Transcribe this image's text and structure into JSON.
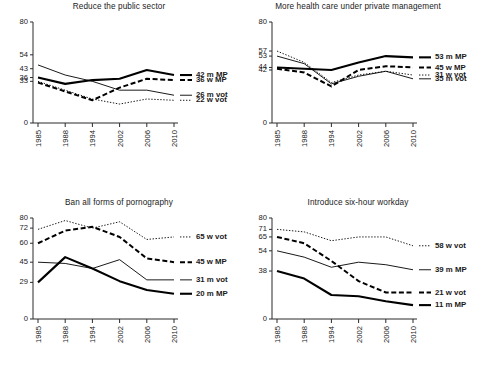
{
  "figure": {
    "name": "four-panel-line-chart",
    "x_categories": [
      "1985",
      "1988",
      "1994",
      "2002",
      "2006",
      "2010"
    ]
  },
  "chart_data": [
    {
      "type": "line",
      "panel": "top-left",
      "title": "Reduce the public sector",
      "xlabel": "",
      "ylabel": "",
      "x": [
        "1985",
        "1988",
        "1994",
        "2002",
        "2006",
        "2010"
      ],
      "ylim": [
        0,
        80
      ],
      "yticks": [
        0,
        33,
        36,
        43,
        54,
        80
      ],
      "ytick_labels": [
        "0",
        "33",
        "36",
        "43",
        "54",
        "80"
      ],
      "grid": false,
      "legend_position": "right",
      "series": [
        {
          "name": "42 m MP",
          "style": "thick",
          "values": [
            36,
            31,
            34,
            35,
            42,
            38
          ]
        },
        {
          "name": "36 w MP",
          "style": "dashed",
          "values": [
            32,
            25,
            18,
            28,
            35,
            34
          ]
        },
        {
          "name": "26 m vot",
          "style": "thin",
          "values": [
            46,
            38,
            33,
            26,
            26,
            22
          ]
        },
        {
          "name": "22 w vot",
          "style": "dotted",
          "values": [
            33,
            26,
            19,
            15,
            19,
            18
          ]
        }
      ]
    },
    {
      "type": "line",
      "panel": "top-right",
      "title": "More health care under private management",
      "xlabel": "",
      "ylabel": "",
      "x": [
        "1985",
        "1988",
        "1994",
        "2002",
        "2006",
        "2010"
      ],
      "ylim": [
        0,
        80
      ],
      "yticks": [
        0,
        42,
        44,
        53,
        57,
        80
      ],
      "ytick_labels": [
        "0",
        "42",
        "44",
        "53",
        "57",
        "80"
      ],
      "grid": false,
      "legend_position": "right",
      "series": [
        {
          "name": "53 m MP",
          "style": "thick",
          "values": [
            44,
            43,
            42,
            48,
            53,
            52
          ]
        },
        {
          "name": "45 w MP",
          "style": "dashed",
          "values": [
            43,
            40,
            29,
            42,
            45,
            44
          ]
        },
        {
          "name": "35 m vot",
          "style": "thin",
          "values": [
            53,
            47,
            31,
            37,
            41,
            35
          ]
        },
        {
          "name": "31 w vot",
          "style": "dotted",
          "values": [
            57,
            48,
            32,
            38,
            41,
            38
          ]
        }
      ]
    },
    {
      "type": "line",
      "panel": "bottom-left",
      "title": "Ban all forms of pornography",
      "xlabel": "",
      "ylabel": "",
      "x": [
        "1985",
        "1988",
        "1994",
        "2002",
        "2006",
        "2010"
      ],
      "ylim": [
        0,
        80
      ],
      "yticks": [
        0,
        29,
        45,
        60,
        72,
        80
      ],
      "ytick_labels": [
        "0",
        "29",
        "45",
        "60",
        "72",
        "80"
      ],
      "grid": false,
      "legend_position": "right",
      "series": [
        {
          "name": "65 w vot",
          "style": "dotted",
          "values": [
            71,
            78,
            72,
            77,
            63,
            65
          ]
        },
        {
          "name": "45 w MP",
          "style": "dashed",
          "values": [
            60,
            70,
            73,
            65,
            48,
            45
          ]
        },
        {
          "name": "31 m vot",
          "style": "thin",
          "values": [
            45,
            44,
            40,
            47,
            31,
            31
          ]
        },
        {
          "name": "20 m MP",
          "style": "thick",
          "values": [
            29,
            49,
            40,
            30,
            23,
            20
          ]
        }
      ]
    },
    {
      "type": "line",
      "panel": "bottom-right",
      "title": "Introduce six-hour workday",
      "xlabel": "",
      "ylabel": "",
      "x": [
        "1985",
        "1988",
        "1994",
        "2002",
        "2006",
        "2010"
      ],
      "ylim": [
        0,
        80
      ],
      "yticks": [
        0,
        38,
        54,
        65,
        71,
        80
      ],
      "ytick_labels": [
        "0",
        "38",
        "54",
        "65",
        "71",
        "80"
      ],
      "grid": false,
      "legend_position": "right",
      "series": [
        {
          "name": "58 w vot",
          "style": "dotted",
          "values": [
            71,
            69,
            62,
            65,
            65,
            58
          ]
        },
        {
          "name": "39 m MP",
          "style": "thin",
          "values": [
            54,
            49,
            41,
            45,
            43,
            39
          ]
        },
        {
          "name": "21 w vot",
          "style": "dashed",
          "values": [
            65,
            60,
            46,
            30,
            21,
            21
          ]
        },
        {
          "name": "11 m MP",
          "style": "thick",
          "values": [
            38,
            32,
            19,
            18,
            14,
            11
          ]
        }
      ]
    }
  ]
}
